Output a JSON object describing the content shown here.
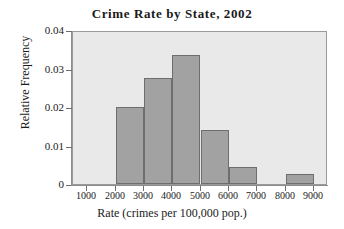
{
  "chart_data": {
    "type": "bar",
    "title": "Crime Rate by State, 2002",
    "xlabel": "Rate (crimes per 100,000 pop.)",
    "ylabel": "Relative Frequency",
    "grid": false,
    "legend": null,
    "xlim": [
      500,
      9500
    ],
    "ylim": [
      0,
      0.04
    ],
    "bin_width": 1000,
    "x_ticks": [
      1000,
      2000,
      3000,
      4000,
      5000,
      6000,
      7000,
      8000,
      9000
    ],
    "x_tick_labels": [
      "1000",
      "2000",
      "3000",
      "4000",
      "5000",
      "6000",
      "7000",
      "8000",
      "9000"
    ],
    "y_ticks": [
      0,
      0.01,
      0.02,
      0.03,
      0.04
    ],
    "y_tick_labels": [
      "0",
      "0.01",
      "0.02",
      "0.03",
      "0.04"
    ],
    "categories": [
      "2000-3000",
      "3000-4000",
      "4000-5000",
      "5000-6000",
      "6000-7000",
      "7000-8000",
      "8000-9000"
    ],
    "bin_edges": [
      2000,
      3000,
      4000,
      5000,
      6000,
      7000,
      8000,
      9000
    ],
    "values": [
      0.02,
      0.0275,
      0.0335,
      0.014,
      0.0045,
      0,
      0.0025
    ],
    "colors": {
      "bar_fill": "#a2a2a2",
      "bar_edge": "#6e6e6e",
      "plot_background": "#e9e9e9",
      "figure_background": "#ffffff",
      "axis": "#8d8d8d",
      "text": "#1a1a1a"
    }
  }
}
